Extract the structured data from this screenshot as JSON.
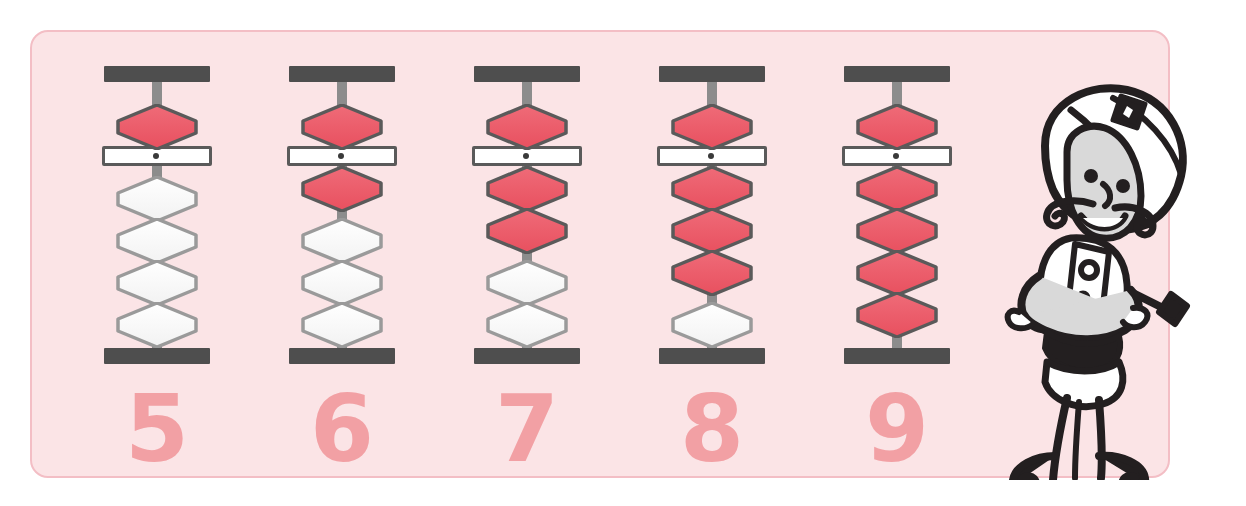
{
  "panel": {
    "background_color": "#fbe4e6",
    "border_color": "#f3bec5"
  },
  "colors": {
    "bead_active": "#e8505f",
    "bead_active_light": "#ef6b78",
    "bead_inactive": "#f2f2f2",
    "bead_inactive_outline": "#9a9a9a",
    "bead_active_outline": "#5a5a5a",
    "frame": "#4e4e4e",
    "rod": "#8c8c8c",
    "numeral": "#f2a0a4",
    "mascot_ink": "#231f20",
    "mascot_skin": "#d9d9d9",
    "mascot_accent": "#a81c4a"
  },
  "columns": [
    {
      "numeral": "5",
      "value": 5,
      "heaven_bead_active": true,
      "earth_beads_active": 0,
      "earth_beads_inactive": 4,
      "beads": [
        {
          "position": "heaven",
          "state": "active",
          "color": "red"
        },
        {
          "position": "earth",
          "state": "inactive",
          "color": "white"
        },
        {
          "position": "earth",
          "state": "inactive",
          "color": "white"
        },
        {
          "position": "earth",
          "state": "inactive",
          "color": "white"
        },
        {
          "position": "earth",
          "state": "inactive",
          "color": "white"
        }
      ]
    },
    {
      "numeral": "6",
      "value": 6,
      "heaven_bead_active": true,
      "earth_beads_active": 1,
      "earth_beads_inactive": 3,
      "beads": [
        {
          "position": "heaven",
          "state": "active",
          "color": "red"
        },
        {
          "position": "earth",
          "state": "active",
          "color": "red"
        },
        {
          "position": "earth",
          "state": "inactive",
          "color": "white"
        },
        {
          "position": "earth",
          "state": "inactive",
          "color": "white"
        },
        {
          "position": "earth",
          "state": "inactive",
          "color": "white"
        }
      ]
    },
    {
      "numeral": "7",
      "value": 7,
      "heaven_bead_active": true,
      "earth_beads_active": 2,
      "earth_beads_inactive": 2,
      "beads": [
        {
          "position": "heaven",
          "state": "active",
          "color": "red"
        },
        {
          "position": "earth",
          "state": "active",
          "color": "red"
        },
        {
          "position": "earth",
          "state": "active",
          "color": "red"
        },
        {
          "position": "earth",
          "state": "inactive",
          "color": "white"
        },
        {
          "position": "earth",
          "state": "inactive",
          "color": "white"
        }
      ]
    },
    {
      "numeral": "8",
      "value": 8,
      "heaven_bead_active": true,
      "earth_beads_active": 3,
      "earth_beads_inactive": 1,
      "beads": [
        {
          "position": "heaven",
          "state": "active",
          "color": "red"
        },
        {
          "position": "earth",
          "state": "active",
          "color": "red"
        },
        {
          "position": "earth",
          "state": "active",
          "color": "red"
        },
        {
          "position": "earth",
          "state": "active",
          "color": "red"
        },
        {
          "position": "earth",
          "state": "inactive",
          "color": "white"
        }
      ]
    },
    {
      "numeral": "9",
      "value": 9,
      "heaven_bead_active": true,
      "earth_beads_active": 4,
      "earth_beads_inactive": 0,
      "beads": [
        {
          "position": "heaven",
          "state": "active",
          "color": "red"
        },
        {
          "position": "earth",
          "state": "active",
          "color": "red"
        },
        {
          "position": "earth",
          "state": "active",
          "color": "red"
        },
        {
          "position": "earth",
          "state": "active",
          "color": "red"
        },
        {
          "position": "earth",
          "state": "active",
          "color": "red"
        }
      ]
    }
  ],
  "mascot": {
    "name": "mustached-genie-character",
    "description": "cartoon character with turban hat, mustache, crossed arms, curly-toed shoes, holding a pointer with a diamond tip"
  }
}
